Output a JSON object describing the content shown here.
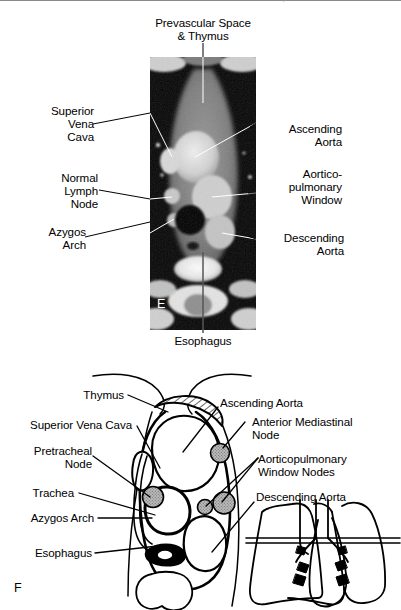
{
  "page": {
    "running_head": "Mediastinum and Hilum: Normal Anatomy",
    "panel_letters": {
      "ct": "E",
      "diagram": "F"
    },
    "line_color": "#000000",
    "node_fill": "#b3b3b3",
    "image_background": "#000000",
    "paper_background": "#ffffff"
  },
  "ct_panel": {
    "name": "axial-ct-mediastinum",
    "modality": "CT",
    "level": "aorticopulmonary window",
    "labels": {
      "top": "Prevascular Space\n& Thymus",
      "bottom": "Esophagus",
      "left": [
        {
          "id": "svc",
          "text": "Superior\nVena\nCava"
        },
        {
          "id": "node",
          "text": "Normal\nLymph\nNode"
        },
        {
          "id": "azygos",
          "text": "Azygos\nArch"
        }
      ],
      "right": [
        {
          "id": "asc-aorta",
          "text": "Ascending\nAorta"
        },
        {
          "id": "ap-window",
          "text": "Aortico-\npulmonary\nWindow"
        },
        {
          "id": "desc-aorta",
          "text": "Descending\nAorta"
        }
      ]
    }
  },
  "diagram_panel": {
    "name": "mediastinum-line-drawing",
    "labels": {
      "left": [
        {
          "id": "thymus",
          "text": "Thymus"
        },
        {
          "id": "svc",
          "text": "Superior Vena Cava"
        },
        {
          "id": "pretracheal",
          "text": "Pretracheal\nNode"
        },
        {
          "id": "trachea",
          "text": "Trachea"
        },
        {
          "id": "azygos",
          "text": "Azygos Arch"
        },
        {
          "id": "esophagus",
          "text": "Esophagus"
        }
      ],
      "right": [
        {
          "id": "asc-aorta",
          "text": "Ascending Aorta"
        },
        {
          "id": "ant-med-node",
          "text": "Anterior Mediastinal\nNode"
        },
        {
          "id": "ap-nodes",
          "text": "Aorticopulmonary\nWindow Nodes"
        },
        {
          "id": "desc-aorta",
          "text": "Descending Aorta"
        }
      ]
    },
    "inset": {
      "name": "thorax-level-inset",
      "description": "coronal lung outline with scan-level line"
    }
  }
}
